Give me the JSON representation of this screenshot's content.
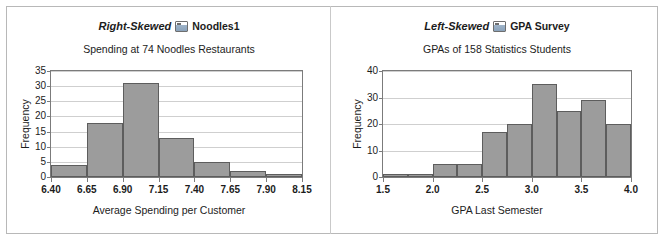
{
  "figure": {
    "background": "#ffffff",
    "frame_color": "#b8b8b8",
    "bar_fill": "#9c9c9c",
    "bar_edge": "#5d5d5d",
    "grid_color": "#cfcfcf",
    "axis_color": "#7b7b7b"
  },
  "panels": [
    {
      "skew_label": "Right-Skewed",
      "icon": "worksheet-icon",
      "dataset_label": "Noodles1"
    },
    {
      "skew_label": "Left-Skewed",
      "icon": "worksheet-icon",
      "dataset_label": "GPA Survey"
    }
  ],
  "chart_data": [
    {
      "type": "bar",
      "title": "Spending at 74 Noodles Restaurants",
      "xlabel": "Average Spending per Customer",
      "ylabel": "Frequency",
      "xlim": [
        6.4,
        8.15
      ],
      "ylim": [
        0,
        35
      ],
      "xticks": [
        "6.40",
        "6.65",
        "6.90",
        "7.15",
        "7.40",
        "7.65",
        "7.90",
        "8.15"
      ],
      "xtick_values": [
        6.4,
        6.65,
        6.9,
        7.15,
        7.4,
        7.65,
        7.9,
        8.15
      ],
      "yticks": [
        "0",
        "5",
        "10",
        "15",
        "20",
        "25",
        "30",
        "35"
      ],
      "ytick_values": [
        0,
        5,
        10,
        15,
        20,
        25,
        30,
        35
      ],
      "bin_width": 0.25,
      "bin_edges": [
        6.4,
        6.65,
        6.9,
        7.15,
        7.4,
        7.65,
        7.9,
        8.15
      ],
      "values": [
        4,
        18,
        31,
        13,
        5,
        2,
        1
      ],
      "grid": "horizontal",
      "legend": "none"
    },
    {
      "type": "bar",
      "title": "GPAs of 158 Statistics Students",
      "xlabel": "GPA Last Semester",
      "ylabel": "Frequency",
      "xlim": [
        1.5,
        4.0
      ],
      "ylim": [
        0,
        40
      ],
      "xticks": [
        "1.5",
        "2.0",
        "2.5",
        "3.0",
        "3.5",
        "4.0"
      ],
      "xtick_values": [
        1.5,
        2.0,
        2.5,
        3.0,
        3.5,
        4.0
      ],
      "yticks": [
        "0",
        "10",
        "20",
        "30",
        "40"
      ],
      "ytick_values": [
        0,
        10,
        20,
        30,
        40
      ],
      "bin_width": 0.25,
      "bin_edges": [
        1.5,
        1.75,
        2.0,
        2.25,
        2.5,
        2.75,
        3.0,
        3.25,
        3.5,
        3.75,
        4.0
      ],
      "values": [
        1,
        1,
        5,
        5,
        17,
        20,
        35,
        25,
        29,
        20
      ],
      "grid": "horizontal",
      "legend": "none"
    }
  ]
}
